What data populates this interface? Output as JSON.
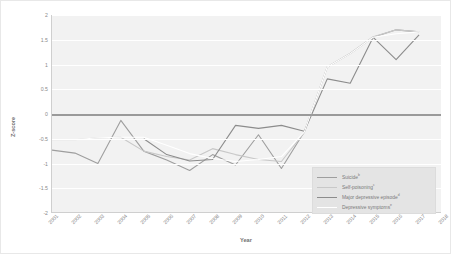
{
  "chart_data": {
    "type": "line",
    "title": "",
    "xlabel": "Year",
    "ylabel": "Z-score",
    "x": [
      2001,
      2002,
      2003,
      2004,
      2005,
      2006,
      2007,
      2008,
      2009,
      2010,
      2011,
      2012,
      2013,
      2014,
      2015,
      2016,
      2017,
      2018
    ],
    "xlim": [
      2001,
      2018
    ],
    "ylim": [
      -2,
      2
    ],
    "yticks": [
      "2",
      "1.5",
      "1",
      "0.5",
      "0",
      "-0.5",
      "-1",
      "-1.5",
      "-2"
    ],
    "ytick_values": [
      2,
      1.5,
      1,
      0.5,
      0,
      -0.5,
      -1,
      -1.5,
      -2
    ],
    "xticks": [
      "2001",
      "2002",
      "2003",
      "2004",
      "2005",
      "2006",
      "2007",
      "2008",
      "2009",
      "2010",
      "2011",
      "2012",
      "2013",
      "2014",
      "2015",
      "2016",
      "2017",
      "2018"
    ],
    "grid": true,
    "zero_line": true,
    "legend_position": "lower right",
    "series": [
      {
        "name": "Suicide",
        "footnote": "b",
        "color": "#9e9e9e",
        "x": [
          2001,
          2002,
          2003,
          2004,
          2005,
          2006,
          2007,
          2008,
          2009,
          2010,
          2011,
          2012,
          2013,
          2014,
          2015,
          2016,
          2017
        ],
        "values": [
          -0.73,
          -0.79,
          -1.0,
          -0.13,
          -0.75,
          -0.93,
          -1.14,
          -0.82,
          -1.03,
          -0.42,
          -1.1,
          -0.36,
          0.95,
          1.22,
          1.55,
          1.7,
          1.66
        ]
      },
      {
        "name": "Self-poisoning",
        "footnote": "c",
        "color": "#c8c8c8",
        "x": [
          2001,
          2002,
          2003,
          2004,
          2005,
          2006,
          2007,
          2008,
          2009,
          2010,
          2011,
          2012,
          2013,
          2014,
          2015,
          2016,
          2017
        ],
        "values": [
          -0.52,
          -0.52,
          -0.48,
          -0.47,
          -0.75,
          -0.86,
          -0.93,
          -0.7,
          -0.82,
          -0.92,
          -0.96,
          -0.37,
          0.95,
          1.23,
          1.56,
          1.7,
          1.66
        ]
      },
      {
        "name": "Major depressive episode",
        "footnote": "d",
        "color": "#8c8c8c",
        "x": [
          2005,
          2006,
          2007,
          2008,
          2009,
          2010,
          2011,
          2012,
          2013,
          2014,
          2015,
          2016,
          2017
        ],
        "values": [
          -0.5,
          -0.82,
          -0.95,
          -0.92,
          -0.23,
          -0.29,
          -0.23,
          -0.35,
          0.71,
          0.62,
          1.55,
          1.1,
          1.6
        ]
      },
      {
        "name": "Depressive symptoms",
        "footnote": "e",
        "color": "#ffffff",
        "x": [
          2001,
          2002,
          2003,
          2004,
          2005,
          2006,
          2007,
          2008,
          2009,
          2010,
          2011,
          2012,
          2013,
          2014,
          2015,
          2016,
          2017
        ],
        "values": [
          -0.52,
          -0.52,
          -0.48,
          -0.47,
          -0.47,
          -0.63,
          -0.8,
          -0.9,
          -0.96,
          -0.92,
          -0.86,
          -0.36,
          0.95,
          1.22,
          1.55,
          1.62,
          1.66
        ]
      }
    ]
  },
  "legend": {
    "items": [
      {
        "label": "Suicide",
        "footnote": "b"
      },
      {
        "label": "Self-poisoning",
        "footnote": "c"
      },
      {
        "label": "Major depressive episode",
        "footnote": "d"
      },
      {
        "label": "Depressive symptoms",
        "footnote": "e"
      }
    ]
  }
}
